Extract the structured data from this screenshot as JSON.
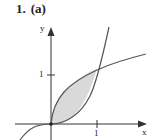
{
  "figure": {
    "problem_number": "1.",
    "part": "(a)"
  },
  "axes": {
    "x_label": "x",
    "y_label": "y",
    "x_tick_label": "1",
    "y_tick_label": "1"
  },
  "curves": [
    {
      "name": "cubic",
      "expression": "y = x^3"
    },
    {
      "name": "square-root",
      "expression": "y = sqrt(x)"
    }
  ],
  "shaded_region": {
    "x_from": 0,
    "x_to": 1,
    "fill": "#d9d9d9"
  },
  "colors": {
    "stroke": "#555555",
    "axis": "#333333",
    "fill": "#d9d9d9"
  }
}
